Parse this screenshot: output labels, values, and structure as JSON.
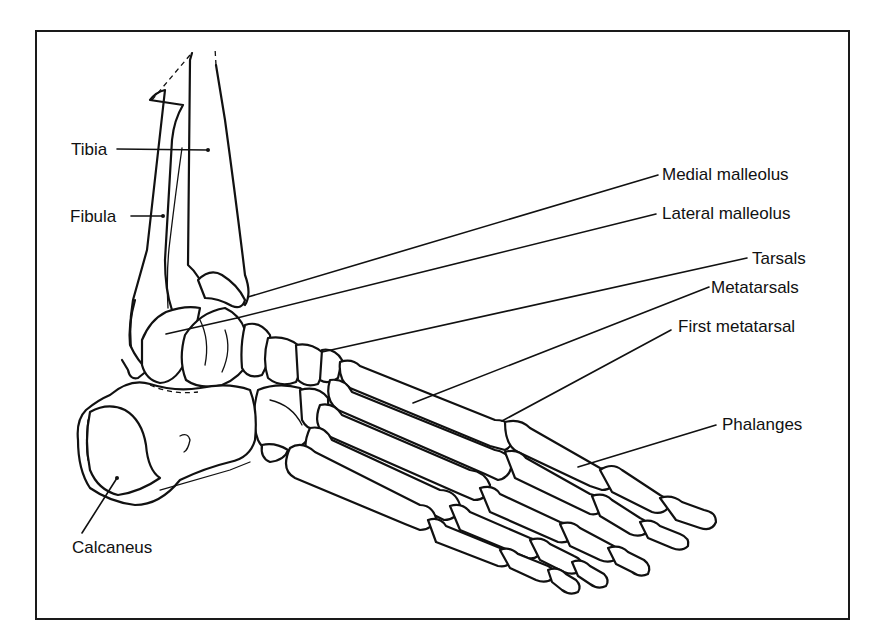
{
  "diagram": {
    "title": "",
    "labels": {
      "tibia": "Tibia",
      "fibula": "Fibula",
      "medial_malleolus": "Medial malleolus",
      "lateral_malleolus": "Lateral malleolus",
      "tarsals": "Tarsals",
      "metatarsals": "Metatarsals",
      "first_metatarsal": "First metatarsal",
      "phalanges": "Phalanges",
      "calcaneus": "Calcaneus"
    },
    "colors": {
      "line": "#111111",
      "background": "#ffffff"
    }
  }
}
